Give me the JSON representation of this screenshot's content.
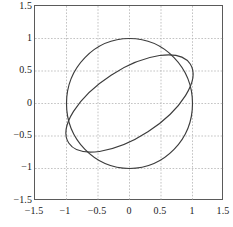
{
  "chart_data": {
    "type": "line",
    "title": "",
    "xlabel": "",
    "ylabel": "",
    "xlim": [
      -1.5,
      1.5
    ],
    "ylim": [
      -1.5,
      1.5
    ],
    "grid": true,
    "grid_style": "dotted",
    "grid_color": "#b4b4b4",
    "legend": "none",
    "axis_color": "#5a5a5a",
    "curve_color": "#3c3c3c",
    "xticks": [
      -1.5,
      -1,
      -0.5,
      0,
      0.5,
      1,
      1.5
    ],
    "yticks": [
      -1.5,
      -1,
      -0.5,
      0,
      0.5,
      1,
      1.5
    ],
    "xtick_labels": [
      "−1.5",
      "−1",
      "−0.5",
      "0",
      "0.5",
      "1",
      "1.5"
    ],
    "ytick_labels": [
      "1.5",
      "1",
      "0.5",
      "0",
      "−0.5",
      "−1",
      "−1.5"
    ],
    "series": [
      {
        "name": "unit circle",
        "shape": "circle",
        "center": [
          0,
          0
        ],
        "radius": 1,
        "rotation_deg": 0
      },
      {
        "name": "rotated ellipse",
        "shape": "ellipse",
        "center": [
          0,
          0
        ],
        "semi_major": 1.15,
        "semi_minor": 0.52,
        "rotation_deg": 33,
        "extreme_top": [
          0.45,
          0.65
        ],
        "extreme_bottom": [
          -0.5,
          -0.65
        ]
      }
    ]
  }
}
